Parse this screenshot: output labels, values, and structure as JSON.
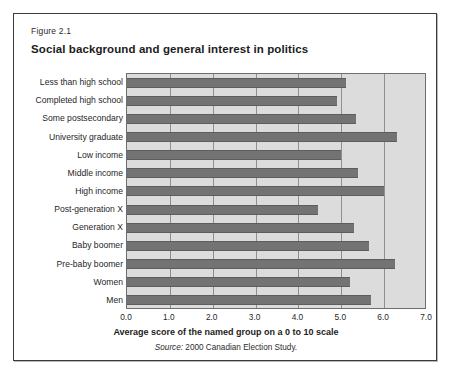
{
  "figure": {
    "number": "Figure 2.1",
    "title": "Social background and general interest in politics",
    "source_prefix": "Source:",
    "source_text": " 2000 Canadian Election Study."
  },
  "colors": {
    "plot_background": "#dcdcdc",
    "bar_fill": "#737373",
    "gridline": "#8f8f8f",
    "frame_border": "#3c3c3c",
    "text": "#1f1f1f"
  },
  "chart_data": {
    "type": "bar",
    "orientation": "horizontal",
    "title": "Social background and general interest in politics",
    "xlabel": "Average score of the named group on a 0 to 10 scale",
    "ylabel": "",
    "xlim": [
      0.0,
      7.0
    ],
    "xticks": [
      "0.0",
      "1.0",
      "2.0",
      "3.0",
      "4.0",
      "5.0",
      "6.0",
      "7.0"
    ],
    "xtick_values": [
      0,
      1,
      2,
      3,
      4,
      5,
      6,
      7
    ],
    "grid": true,
    "legend": "none",
    "categories": [
      "Less than high school",
      "Completed high school",
      "Some postsecondary",
      "University graduate",
      "Low income",
      "Middle income",
      "High income",
      "Post-generation X",
      "Generation X",
      "Baby boomer",
      "Pre-baby boomer",
      "Women",
      "Men"
    ],
    "values": [
      5.1,
      4.9,
      5.35,
      6.3,
      5.0,
      5.4,
      6.0,
      4.45,
      5.3,
      5.65,
      6.25,
      5.2,
      5.7
    ],
    "source": "Source: 2000 Canadian Election Study."
  }
}
